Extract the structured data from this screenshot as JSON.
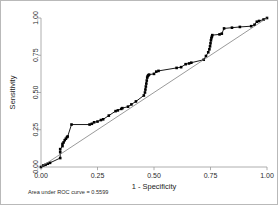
{
  "figure": {
    "background_color": "#ffffff",
    "border_color": "#b9b9b9",
    "note": "Area under ROC curve = 0.5599"
  },
  "chart_data": {
    "type": "line",
    "title": "",
    "subtitle": "",
    "xlabel": "1 - Specificity",
    "ylabel": "Sensitivity",
    "xlim": [
      0,
      1
    ],
    "ylim": [
      0,
      1
    ],
    "grid": false,
    "legend_position": "none",
    "annotations": [
      {
        "text": "Area under ROC curve = 0.5599",
        "x": 0.0,
        "y": -0.16,
        "name": "auc-note"
      }
    ],
    "xticks": [
      0,
      0.25,
      0.5,
      0.75,
      1
    ],
    "xtick_labels": [
      "0.00",
      "0.25",
      "0.50",
      "0.75",
      "1.00"
    ],
    "yticks": [
      0,
      0.25,
      0.5,
      0.75,
      1
    ],
    "ytick_labels": [
      "0.00",
      "0.25",
      "0.50",
      "0.75",
      "1.00"
    ],
    "series": [
      {
        "name": "ROC curve",
        "color": "#000000",
        "marker": "square",
        "marker_size": 2.6,
        "line_width": 0.9,
        "x": [
          0.0,
          0.01,
          0.02,
          0.03,
          0.04,
          0.085,
          0.085,
          0.085,
          0.095,
          0.095,
          0.1,
          0.105,
          0.11,
          0.115,
          0.118,
          0.135,
          0.215,
          0.225,
          0.235,
          0.25,
          0.265,
          0.275,
          0.3,
          0.33,
          0.34,
          0.355,
          0.36,
          0.385,
          0.4,
          0.42,
          0.455,
          0.46,
          0.462,
          0.464,
          0.466,
          0.468,
          0.47,
          0.472,
          0.475,
          0.478,
          0.5,
          0.51,
          0.52,
          0.6,
          0.62,
          0.64,
          0.655,
          0.665,
          0.72,
          0.73,
          0.74,
          0.745,
          0.748,
          0.75,
          0.752,
          0.754,
          0.756,
          0.758,
          0.79,
          0.8,
          0.81,
          0.845,
          0.88,
          0.93,
          0.945,
          0.955,
          0.965,
          0.985,
          1.0
        ],
        "y": [
          0.0,
          0.01,
          0.015,
          0.022,
          0.028,
          0.06,
          0.1,
          0.12,
          0.14,
          0.155,
          0.165,
          0.18,
          0.19,
          0.2,
          0.205,
          0.285,
          0.285,
          0.29,
          0.3,
          0.305,
          0.315,
          0.32,
          0.345,
          0.375,
          0.38,
          0.39,
          0.395,
          0.405,
          0.42,
          0.44,
          0.48,
          0.5,
          0.52,
          0.54,
          0.56,
          0.58,
          0.6,
          0.61,
          0.615,
          0.62,
          0.625,
          0.64,
          0.645,
          0.665,
          0.67,
          0.69,
          0.695,
          0.7,
          0.72,
          0.745,
          0.77,
          0.79,
          0.81,
          0.83,
          0.85,
          0.865,
          0.875,
          0.885,
          0.89,
          0.895,
          0.93,
          0.935,
          0.94,
          0.945,
          0.955,
          0.975,
          0.98,
          0.99,
          1.0
        ]
      },
      {
        "name": "Reference line",
        "color": "#6f6f6f",
        "marker": "none",
        "line_width": 0.7,
        "x": [
          0,
          1
        ],
        "y": [
          0,
          1
        ]
      }
    ]
  }
}
